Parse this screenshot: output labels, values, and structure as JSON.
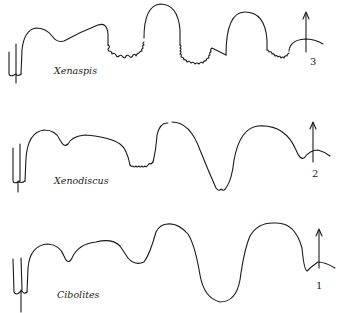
{
  "figure": {
    "type": "ammonoid suture line comparison",
    "rows": [
      {
        "index": 0,
        "taxon": "Xenaspis",
        "number": "3",
        "ornament": "ceratitic (serrated lobes)"
      },
      {
        "index": 1,
        "taxon": "Xenodiscus",
        "number": "2",
        "ornament": "weakly serrated lobes"
      },
      {
        "index": 2,
        "taxon": "Cibolites",
        "number": "1",
        "ornament": "goniatitic (smooth)"
      }
    ],
    "marker": "arrow pointing up at venter (right side)",
    "stroke_color": "#1a1a1a",
    "background": "#ffffff"
  }
}
